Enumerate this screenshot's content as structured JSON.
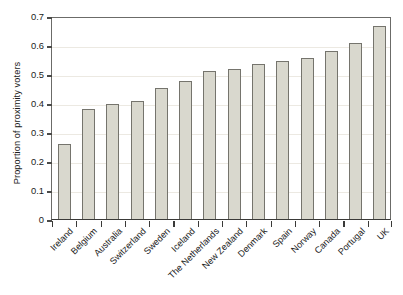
{
  "chart_data": {
    "type": "bar",
    "title": "",
    "xlabel": "",
    "ylabel": "Proportion of proximity voters",
    "ylim": [
      0,
      0.7
    ],
    "yticks": [
      "0",
      "0.1",
      "0.2",
      "0.3",
      "0.4",
      "0.5",
      "0.6",
      "0.7"
    ],
    "ytick_values": [
      0,
      0.1,
      0.2,
      0.3,
      0.4,
      0.5,
      0.6,
      0.7
    ],
    "grid": true,
    "legend": "none",
    "bar_fill_color": "#d9d8ce",
    "bar_edge_color": "#75746d",
    "categories": [
      "Ireland",
      "Belgium",
      "Australia",
      "Switzerland",
      "Sweden",
      "Iceland",
      "The Netherlands",
      "New Zealand",
      "Denmark",
      "Spain",
      "Norway",
      "Canada",
      "Portugal",
      "UK"
    ],
    "values": [
      0.258,
      0.379,
      0.396,
      0.407,
      0.452,
      0.476,
      0.511,
      0.516,
      0.534,
      0.544,
      0.556,
      0.579,
      0.608,
      0.665
    ]
  }
}
